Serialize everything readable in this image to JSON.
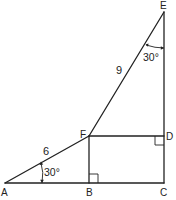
{
  "diagram": {
    "points": {
      "A": {
        "label": "A",
        "x": 5,
        "y": 183
      },
      "B": {
        "label": "B",
        "x": 89,
        "y": 183
      },
      "C": {
        "label": "C",
        "x": 164,
        "y": 183
      },
      "D": {
        "label": "D",
        "x": 164,
        "y": 136
      },
      "E": {
        "label": "E",
        "x": 164,
        "y": 12
      },
      "F": {
        "label": "F",
        "x": 89,
        "y": 136
      }
    },
    "segments": [
      {
        "from": "A",
        "to": "C"
      },
      {
        "from": "C",
        "to": "E"
      },
      {
        "from": "E",
        "to": "F"
      },
      {
        "from": "F",
        "to": "A"
      },
      {
        "from": "F",
        "to": "B"
      },
      {
        "from": "F",
        "to": "D"
      }
    ],
    "lengths": {
      "AF": "6",
      "FE": "9"
    },
    "angles": {
      "A": "30°",
      "E": "30°"
    },
    "right_angles": [
      "B",
      "D"
    ],
    "colors": {
      "stroke": "#222222",
      "background": "#ffffff"
    }
  }
}
